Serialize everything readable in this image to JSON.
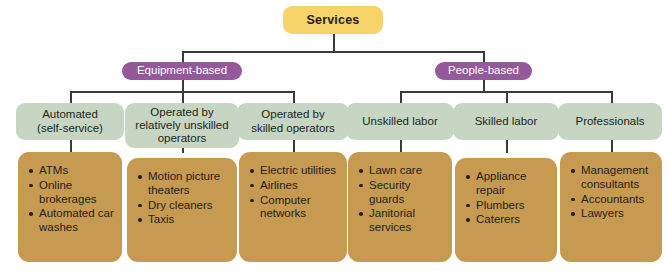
{
  "diagram": {
    "type": "hierarchy-tree",
    "title": "Services",
    "colors": {
      "root": "#F7D469",
      "category": "#95589B",
      "type": "#C6D6C2",
      "examples": "#C79A51",
      "connector": "#3A3A3A",
      "background": "#FFFFFF"
    },
    "root": {
      "label": "Services"
    },
    "categories": [
      {
        "label": "Equipment-based"
      },
      {
        "label": "People-based"
      }
    ],
    "types": [
      {
        "label": "Automated\n(self-service)",
        "line1": "Automated",
        "line2": "(self-service)"
      },
      {
        "label": "Operated by relatively unskilled operators",
        "line1": "Operated by",
        "line2": "relatively unskilled",
        "line3": "operators"
      },
      {
        "label": "Operated by skilled operators",
        "line1": "Operated by",
        "line2": "skilled operators"
      },
      {
        "label": "Unskilled labor",
        "line1": "Unskilled labor"
      },
      {
        "label": "Skilled labor",
        "line1": "Skilled labor"
      },
      {
        "label": "Professionals",
        "line1": "Professionals"
      }
    ],
    "examples": [
      {
        "items": [
          "ATMs",
          "Online brokerages",
          "Automated car washes"
        ]
      },
      {
        "items": [
          "Motion picture theaters",
          "Dry cleaners",
          "Taxis"
        ]
      },
      {
        "items": [
          "Electric utilities",
          "Airlines",
          "Computer networks"
        ]
      },
      {
        "items": [
          "Lawn care",
          "Security guards",
          "Janitorial services"
        ]
      },
      {
        "items": [
          "Appliance repair",
          "Plumbers",
          "Caterers"
        ]
      },
      {
        "items": [
          "Management consultants",
          "Accountants",
          "Lawyers"
        ]
      }
    ]
  }
}
